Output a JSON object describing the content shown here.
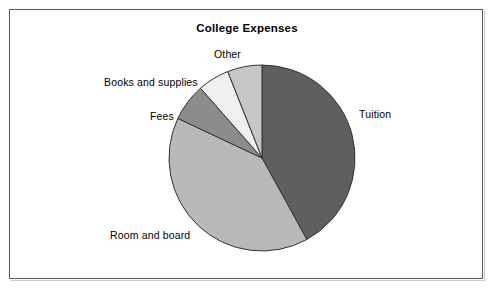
{
  "chart_data": {
    "type": "pie",
    "title": "College Expenses",
    "xlabel": "",
    "ylabel": "",
    "legend_position": "none",
    "grid": false,
    "labels": [
      "Tuition",
      "Room and board",
      "Fees",
      "Books and supplies",
      "Other"
    ],
    "values": [
      42,
      40,
      6.5,
      5.5,
      6
    ],
    "slice_angles_deg": [
      151.2,
      144.0,
      23.4,
      19.8,
      21.6
    ],
    "start_angle_deg": 0,
    "direction": "clockwise",
    "colors": [
      "#5f5f5f",
      "#b9b9b9",
      "#8c8c8c",
      "#f0f0f0",
      "#c6c6c6"
    ],
    "slices": [
      {
        "label": "Tuition",
        "value": 42,
        "color": "#5f5f5f"
      },
      {
        "label": "Room and board",
        "value": 40,
        "color": "#b9b9b9"
      },
      {
        "label": "Fees",
        "value": 6.5,
        "color": "#8c8c8c"
      },
      {
        "label": "Books and supplies",
        "value": 5.5,
        "color": "#f0f0f0"
      },
      {
        "label": "Other",
        "value": 6,
        "color": "#c6c6c6"
      }
    ]
  },
  "labels": {
    "tuition": "Tuition",
    "room_and_board": "Room and board",
    "fees": "Fees",
    "books_and_supplies": "Books and supplies",
    "other": "Other"
  },
  "geometry": {
    "center_x": 262,
    "center_y": 158,
    "radius": 93
  },
  "style": {
    "outline": "#333333",
    "frame": "#5a5a5a",
    "background": "#ffffff"
  }
}
